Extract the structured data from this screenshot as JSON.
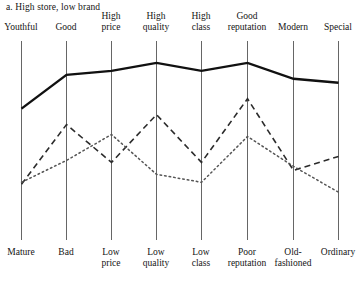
{
  "chart_data": {
    "type": "line",
    "title": "a. High store, low brand",
    "xlabel": "",
    "ylabel": "",
    "grid": "vertical-axes-only",
    "legend_position": "none",
    "axis_count": 8,
    "scale_note": "Semantic differential: each vertical axis runs from the positive adjective (top label) to the negative adjective (bottom label).",
    "ylim": [
      0,
      100
    ],
    "categories_positive": [
      "Youthful",
      "Good",
      "High\nprice",
      "High\nquality",
      "High\nclass",
      "Good\nreputation",
      "Modern",
      "Special"
    ],
    "categories_negative": [
      "Mature",
      "Bad",
      "Low\nprice",
      "Low\nquality",
      "Low\nclass",
      "Poor\nreputation",
      "Old-\nfashioned",
      "Ordinary"
    ],
    "series": [
      {
        "name": "solid-series",
        "style": "solid",
        "color": "#111111",
        "width": 2.4,
        "values": [
          66,
          83,
          85,
          89,
          85,
          89,
          81,
          79
        ]
      },
      {
        "name": "dashed-series",
        "style": "dashed",
        "color": "#2b2b2b",
        "width": 1.6,
        "values": [
          28,
          58,
          39,
          63,
          39,
          71,
          35,
          42
        ]
      },
      {
        "name": "dotted-series",
        "style": "dotted",
        "color": "#555555",
        "width": 1.5,
        "values": [
          29,
          40,
          53,
          33,
          29,
          52,
          37,
          24
        ]
      }
    ]
  },
  "geometry": {
    "axis_x": [
      21,
      66,
      111,
      156,
      201,
      247,
      293,
      338
    ],
    "axis_top_y": 41,
    "axis_bottom_y": 240,
    "top_label_y": [
      22,
      22,
      11,
      11,
      11,
      11,
      22,
      22
    ],
    "bottom_label_y": [
      247,
      247,
      247,
      247,
      247,
      247,
      247,
      247
    ],
    "axis_color": "#666666",
    "axis_width": 1
  }
}
